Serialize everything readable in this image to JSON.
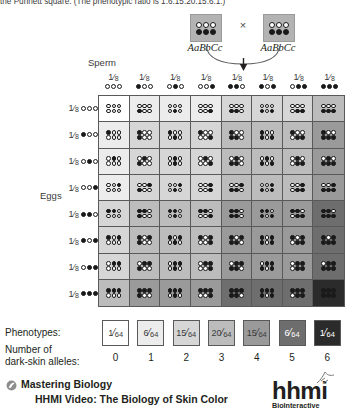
{
  "caption": {
    "text": "the Punnett square. (The phenotypic ratio is 1:6:15:20:15:6:1.)"
  },
  "cross": {
    "parent_left_genotype": "AaBbCc",
    "parent_right_genotype": "AaBbCc",
    "cross_symbol": "×",
    "parent_alleles_top": [
      "w",
      "w",
      "w"
    ],
    "parent_alleles_bottom": [
      "d",
      "d",
      "d"
    ]
  },
  "axes": {
    "sperm_label": "Sperm",
    "eggs_label": "Eggs",
    "gamete_fraction_num": "1",
    "gamete_fraction_den": "8"
  },
  "gametes": {
    "sperm": [
      [
        "w",
        "w",
        "w"
      ],
      [
        "d",
        "w",
        "w"
      ],
      [
        "w",
        "d",
        "w"
      ],
      [
        "w",
        "w",
        "d"
      ],
      [
        "d",
        "d",
        "w"
      ],
      [
        "d",
        "w",
        "d"
      ],
      [
        "w",
        "d",
        "d"
      ],
      [
        "d",
        "d",
        "d"
      ]
    ],
    "eggs": [
      [
        "w",
        "w",
        "w"
      ],
      [
        "d",
        "w",
        "w"
      ],
      [
        "w",
        "d",
        "w"
      ],
      [
        "w",
        "w",
        "d"
      ],
      [
        "d",
        "d",
        "w"
      ],
      [
        "d",
        "w",
        "d"
      ],
      [
        "w",
        "d",
        "d"
      ],
      [
        "d",
        "d",
        "d"
      ]
    ]
  },
  "shades": {
    "0": "#ffffff",
    "1": "#ececec",
    "2": "#d6d6d6",
    "3": "#bcbcbc",
    "4": "#9a9a9a",
    "5": "#6e6e6e",
    "6": "#2b2b2b"
  },
  "legend": {
    "phenotypes_label": "Phenotypes:",
    "alleles_label_line1": "Number of",
    "alleles_label_line2": "dark-skin alleles:",
    "phenotypes": [
      {
        "num": "1",
        "den": "64",
        "dark_alleles": 0
      },
      {
        "num": "6",
        "den": "64",
        "dark_alleles": 1
      },
      {
        "num": "15",
        "den": "64",
        "dark_alleles": 2
      },
      {
        "num": "20",
        "den": "64",
        "dark_alleles": 3
      },
      {
        "num": "15",
        "den": "64",
        "dark_alleles": 4
      },
      {
        "num": "6",
        "den": "64",
        "dark_alleles": 5
      },
      {
        "num": "1",
        "den": "64",
        "dark_alleles": 6
      }
    ],
    "allele_counts": [
      "0",
      "1",
      "2",
      "3",
      "4",
      "5",
      "6"
    ]
  },
  "footer": {
    "mastering_biology": "Mastering Biology",
    "video_title": "HHMI Video: The Biology of Skin Color",
    "logo_word": "hhmi",
    "logo_sub": "BioInteractive"
  }
}
